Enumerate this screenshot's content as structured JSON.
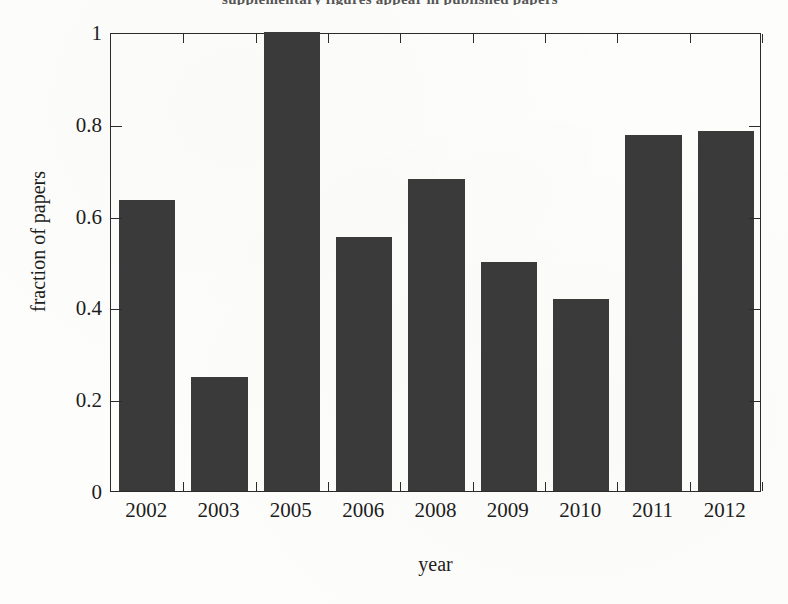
{
  "figure": {
    "title_fragment": "supplementary figures appear in published papers",
    "background_color": "#fdfdfc",
    "axis_color": "#2b2b2b",
    "bar_color": "#3a3a3a"
  },
  "chart_data": {
    "type": "bar",
    "title": "",
    "xlabel": "year",
    "ylabel": "fraction of papers",
    "categories": [
      "2002",
      "2003",
      "2005",
      "2006",
      "2008",
      "2009",
      "2010",
      "2011",
      "2012"
    ],
    "values": [
      0.635,
      0.248,
      1.0,
      0.554,
      0.68,
      0.5,
      0.418,
      0.775,
      0.785
    ],
    "ylim": [
      0,
      1
    ],
    "yticks": [
      0,
      0.2,
      0.4,
      0.6,
      0.8,
      1
    ],
    "ytick_labels": [
      "0",
      "0.2",
      "0.4",
      "0.6",
      "0.8",
      "1"
    ],
    "grid": false,
    "legend": null,
    "bar_color": "#3a3a3a"
  }
}
